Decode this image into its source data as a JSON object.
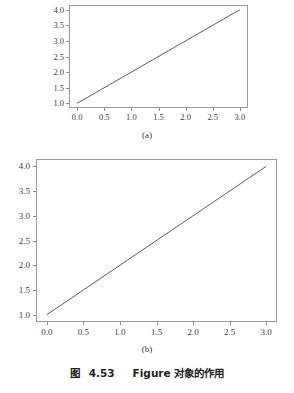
{
  "figure": {
    "caption_label": "图",
    "caption_number": "4.53",
    "caption_text": "Figure 对象的作用",
    "caption_full": "图 4.53　Figure 对象的作用",
    "background_color": "#ffffff",
    "frame_color": "#9a9a9a",
    "line_color": "#4a4a4a"
  },
  "panels": [
    {
      "id": "a",
      "sublabel": "(a)",
      "chart_data": {
        "type": "line",
        "title": "",
        "xlabel": "",
        "ylabel": "",
        "x": [
          0.0,
          3.0
        ],
        "values": [
          1.0,
          4.0
        ],
        "series": [
          {
            "name": "y = x + 1",
            "values": [
              1.0,
              4.0
            ]
          }
        ],
        "xlim": [
          -0.15,
          3.15
        ],
        "ylim": [
          0.85,
          4.15
        ],
        "xticks": [
          0.0,
          0.5,
          1.0,
          1.5,
          2.0,
          2.5,
          3.0
        ],
        "yticks": [
          1.0,
          1.5,
          2.0,
          2.5,
          3.0,
          3.5,
          4.0
        ],
        "xticklabels": [
          "0.0",
          "0.5",
          "1.0",
          "1.5",
          "2.0",
          "2.5",
          "3.0"
        ],
        "yticklabels": [
          "1.0",
          "1.5",
          "2.0",
          "2.5",
          "3.0",
          "3.5",
          "4.0"
        ],
        "grid": false,
        "legend": false
      }
    },
    {
      "id": "b",
      "sublabel": "(b)",
      "chart_data": {
        "type": "line",
        "title": "",
        "xlabel": "",
        "ylabel": "",
        "x": [
          0.0,
          3.0
        ],
        "values": [
          1.0,
          4.0
        ],
        "series": [
          {
            "name": "y = x + 1",
            "values": [
              1.0,
              4.0
            ]
          }
        ],
        "xlim": [
          -0.15,
          3.15
        ],
        "ylim": [
          0.85,
          4.15
        ],
        "xticks": [
          0.0,
          0.5,
          1.0,
          1.5,
          2.0,
          2.5,
          3.0
        ],
        "yticks": [
          1.0,
          1.5,
          2.0,
          2.5,
          3.0,
          3.5,
          4.0
        ],
        "xticklabels": [
          "0.0",
          "0.5",
          "1.0",
          "1.5",
          "2.0",
          "2.5",
          "3.0"
        ],
        "yticklabels": [
          "1.0",
          "1.5",
          "2.0",
          "2.5",
          "3.0",
          "3.5",
          "4.0"
        ],
        "grid": false,
        "legend": false
      }
    }
  ],
  "chart_data": [
    {
      "type": "line",
      "title": "(a)",
      "xlabel": "",
      "ylabel": "",
      "x": [
        0.0,
        3.0
      ],
      "values": [
        1.0,
        4.0
      ],
      "series": [
        {
          "name": "y = x + 1",
          "values": [
            1.0,
            4.0
          ]
        }
      ],
      "xlim": [
        -0.15,
        3.15
      ],
      "ylim": [
        0.85,
        4.15
      ],
      "xticks": [
        0.0,
        0.5,
        1.0,
        1.5,
        2.0,
        2.5,
        3.0
      ],
      "yticks": [
        1.0,
        1.5,
        2.0,
        2.5,
        3.0,
        3.5,
        4.0
      ],
      "grid": false,
      "legend": false
    },
    {
      "type": "line",
      "title": "(b)",
      "xlabel": "",
      "ylabel": "",
      "x": [
        0.0,
        3.0
      ],
      "values": [
        1.0,
        4.0
      ],
      "series": [
        {
          "name": "y = x + 1",
          "values": [
            1.0,
            4.0
          ]
        }
      ],
      "xlim": [
        -0.15,
        3.15
      ],
      "ylim": [
        0.85,
        4.15
      ],
      "xticks": [
        0.0,
        0.5,
        1.0,
        1.5,
        2.0,
        2.5,
        3.0
      ],
      "yticks": [
        1.0,
        1.5,
        2.0,
        2.5,
        3.0,
        3.5,
        4.0
      ],
      "grid": false,
      "legend": false
    }
  ]
}
